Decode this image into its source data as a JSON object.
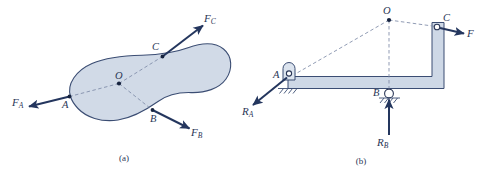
{
  "figure": {
    "kind": "engineering-free-body-diagram",
    "panels": [
      {
        "id": "a",
        "caption": "(a)",
        "description": "Rigid body acted on by three forces",
        "points": [
          {
            "id": "O",
            "label": "O"
          },
          {
            "id": "A",
            "label": "A"
          },
          {
            "id": "B",
            "label": "B"
          },
          {
            "id": "C",
            "label": "C"
          }
        ],
        "forces": [
          {
            "id": "FA",
            "base": "F",
            "sub": "A",
            "at": "A",
            "direction": "left-down"
          },
          {
            "id": "FB",
            "base": "F",
            "sub": "B",
            "at": "B",
            "direction": "right-down"
          },
          {
            "id": "FC",
            "base": "F",
            "sub": "C",
            "at": "C",
            "direction": "right-up"
          }
        ]
      },
      {
        "id": "b",
        "caption": "(b)",
        "description": "Bent bracket member with pin support at A and roller support at B",
        "points": [
          {
            "id": "O",
            "label": "O"
          },
          {
            "id": "A",
            "label": "A"
          },
          {
            "id": "B",
            "label": "B"
          },
          {
            "id": "C",
            "label": "C"
          }
        ],
        "forces": [
          {
            "id": "F",
            "base": "F",
            "sub": "",
            "at": "C",
            "direction": "right-down"
          },
          {
            "id": "RA",
            "base": "R",
            "sub": "A",
            "at": "A",
            "direction": "left-down"
          },
          {
            "id": "RB",
            "base": "R",
            "sub": "B",
            "at": "B",
            "direction": "up"
          }
        ],
        "supports": [
          {
            "id": "pin-A",
            "type": "pin",
            "at": "A"
          },
          {
            "id": "roller-B",
            "type": "roller",
            "at": "B"
          }
        ]
      }
    ],
    "colors": {
      "body_fill": "#c9d4e3",
      "outline": "#3b4d73",
      "force": "#24365e",
      "dashed": "#7d8aa6",
      "background": "#ffffff"
    }
  }
}
